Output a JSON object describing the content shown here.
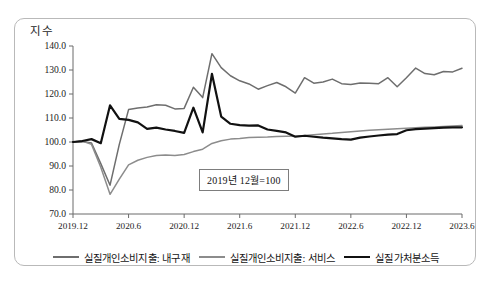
{
  "figure": {
    "yaxis_title": "지수",
    "note": "2019년 12월=100"
  },
  "legend": {
    "items": [
      {
        "label": "실질개인소비지출: 내구재",
        "color": "#6e6e6e",
        "swatch": "sw-durables"
      },
      {
        "label": "실질개인소비지출: 서비스",
        "color": "#8c8c8c",
        "swatch": "sw-services"
      },
      {
        "label": "실질가처분소득",
        "color": "#111111",
        "swatch": "sw-income"
      }
    ]
  },
  "chart_data": {
    "type": "line",
    "title": "",
    "xlabel": "",
    "ylabel": "지수",
    "ylim": [
      70.0,
      140.0
    ],
    "yticks": [
      "70.0",
      "80.0",
      "90.0",
      "100.0",
      "110.0",
      "120.0",
      "130.0",
      "140.0"
    ],
    "ytick_values": [
      70.0,
      80.0,
      90.0,
      100.0,
      110.0,
      120.0,
      130.0,
      140.0
    ],
    "xticks": [
      "2019.12",
      "2020.6",
      "2020.12",
      "2021.6",
      "2021.12",
      "2022.6",
      "2022.12",
      "2023.6"
    ],
    "xtick_index": [
      0,
      6,
      12,
      18,
      24,
      30,
      36,
      42
    ],
    "grid": false,
    "legend_position": "bottom",
    "annotations": [
      {
        "text": "2019년 12월=100",
        "x_index": 14,
        "y_value": 88.5
      }
    ],
    "x": [
      "2019.12",
      "2020.1",
      "2020.2",
      "2020.3",
      "2020.4",
      "2020.5",
      "2020.6",
      "2020.7",
      "2020.8",
      "2020.9",
      "2020.10",
      "2020.11",
      "2020.12",
      "2021.1",
      "2021.2",
      "2021.3",
      "2021.4",
      "2021.5",
      "2021.6",
      "2021.7",
      "2021.8",
      "2021.9",
      "2021.10",
      "2021.11",
      "2021.12",
      "2022.1",
      "2022.2",
      "2022.3",
      "2022.4",
      "2022.5",
      "2022.6",
      "2022.7",
      "2022.8",
      "2022.9",
      "2022.10",
      "2022.11",
      "2022.12",
      "2023.1",
      "2023.2",
      "2023.3",
      "2023.4",
      "2023.5",
      "2023.6"
    ],
    "series": [
      {
        "name": "실질개인소비지출: 내구재",
        "color": "#6e6e6e",
        "values": [
          100.0,
          100.2,
          99.6,
          91.0,
          82.0,
          99.0,
          113.5,
          114.2,
          114.6,
          115.5,
          115.3,
          113.8,
          114.0,
          122.8,
          118.5,
          136.8,
          131.0,
          127.6,
          125.5,
          124.2,
          122.0,
          123.5,
          124.8,
          123.0,
          120.4,
          126.8,
          124.5,
          125.0,
          126.2,
          124.3,
          124.0,
          124.6,
          124.5,
          124.3,
          126.8,
          123.0,
          126.8,
          130.8,
          128.5,
          128.0,
          129.4,
          129.2,
          130.7
        ]
      },
      {
        "name": "실질개인소비지출: 서비스",
        "color": "#8c8c8c",
        "values": [
          100.0,
          100.4,
          99.0,
          89.5,
          78.2,
          84.5,
          90.5,
          92.4,
          93.6,
          94.4,
          94.6,
          94.4,
          94.8,
          96.0,
          97.0,
          99.4,
          100.5,
          101.2,
          101.5,
          101.9,
          102.0,
          102.1,
          102.3,
          102.4,
          102.5,
          102.7,
          103.0,
          103.3,
          103.6,
          104.0,
          104.3,
          104.6,
          104.9,
          105.1,
          105.3,
          105.5,
          105.7,
          105.9,
          106.1,
          106.3,
          106.5,
          106.7,
          106.9
        ]
      },
      {
        "name": "실질가처분소득",
        "color": "#111111",
        "values": [
          100.0,
          100.4,
          101.2,
          99.5,
          115.3,
          109.6,
          109.2,
          108.2,
          105.5,
          106.0,
          105.2,
          104.6,
          103.8,
          114.3,
          104.0,
          128.4,
          110.6,
          107.6,
          107.0,
          106.8,
          106.9,
          105.2,
          104.6,
          104.0,
          102.2,
          102.6,
          102.2,
          101.8,
          101.5,
          101.2,
          101.0,
          101.8,
          102.3,
          102.7,
          103.1,
          103.3,
          104.9,
          105.4,
          105.6,
          105.8,
          106.0,
          106.1,
          106.1
        ]
      }
    ]
  }
}
